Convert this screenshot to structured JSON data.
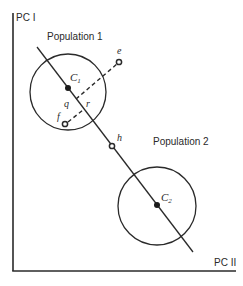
{
  "axes": {
    "y_label": "PC I",
    "x_label": "PC II"
  },
  "populations": [
    {
      "label": "Population 1",
      "centroid_label": "C",
      "centroid_sub": "1"
    },
    {
      "label": "Population 2",
      "centroid_label": "C",
      "centroid_sub": "2"
    }
  ],
  "points": {
    "e": "e",
    "f": "f",
    "h": "h"
  },
  "projection_labels": {
    "q": "q",
    "r": "r"
  },
  "colors": {
    "ink": "#2a2a2a",
    "background": "#ffffff"
  }
}
